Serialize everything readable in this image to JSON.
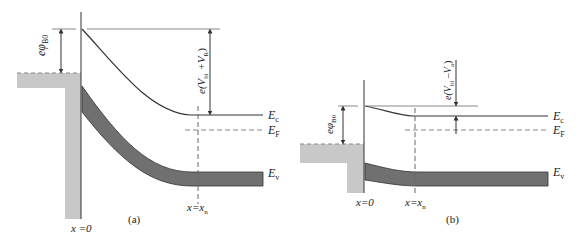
{
  "figure": {
    "panel_a": {
      "caption": "(a)",
      "barrier_label": "eφB0",
      "barrier_label_main": "eφ",
      "barrier_label_sub": "B0",
      "potential_label_main": "e(V",
      "potential_label_sub1": "bi",
      "potential_label_mid": " +V",
      "potential_label_sub2": "R",
      "potential_label_end": ")",
      "potential_label": "e(Vbi + VR)",
      "x0_label": "x =0",
      "xn_label_main": "x=x",
      "xn_label_sub": "n",
      "Ec_main": "E",
      "Ec_sub": "c",
      "EF_main": "E",
      "EF_sub": "F",
      "Ev_main": "E",
      "Ev_sub": "v",
      "condition": "reverse bias"
    },
    "panel_b": {
      "caption": "(b)",
      "barrier_label": "eφB0",
      "barrier_label_main": "eφ",
      "barrier_label_sub": "B0",
      "potential_label_main": "e(V",
      "potential_label_sub1": "bi",
      "potential_label_mid": " –V",
      "potential_label_sub2": "a",
      "potential_label_end": ")",
      "potential_label": "e(Vbi – Va)",
      "x0_label": "x=0",
      "xn_label_main": "x=x",
      "xn_label_sub": "n",
      "Ec_main": "E",
      "Ec_sub": "c",
      "EF_main": "E",
      "EF_sub": "F",
      "Ev_main": "E",
      "Ev_sub": "v",
      "condition": "forward bias"
    },
    "colors": {
      "metal_fill": "#c8c8c8",
      "valence_band_fill": "#707070",
      "line": "#333333",
      "dashed": "#888888"
    }
  }
}
